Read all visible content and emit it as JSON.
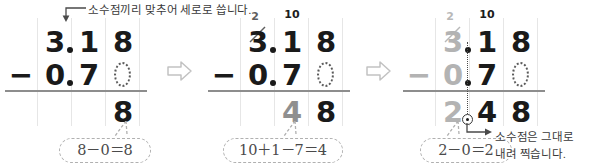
{
  "notes": {
    "top": "소수점끼리 맞추어 세로로 씁니다.",
    "side_line1": "소수점은 그대로",
    "side_line2": "내려 찍습니다."
  },
  "colors": {
    "ink": "#1a1a1a",
    "faded": "#b3b3b3",
    "mid": "#8f8f8f",
    "gridline": "#e6e6e6",
    "rule": "#8d8d8d",
    "bubble_border": "#b0b0b0"
  },
  "panels": [
    {
      "id": "panel-1",
      "minuend": {
        "ones": "3",
        "tenths": "1",
        "hundredths": "8"
      },
      "subtrahend": {
        "ones": "0",
        "tenths": "7",
        "hundredths": "0"
      },
      "result": {
        "ones": "",
        "tenths": "",
        "hundredths": "8"
      },
      "operator": "−",
      "borrow_ones": "",
      "borrow_tenths": "",
      "bubble": "8－0＝8"
    },
    {
      "id": "panel-2",
      "minuend": {
        "ones": "3",
        "tenths": "1",
        "hundredths": "8"
      },
      "subtrahend": {
        "ones": "0",
        "tenths": "7",
        "hundredths": "0"
      },
      "result": {
        "ones": "",
        "tenths": "4",
        "hundredths": "8"
      },
      "operator": "−",
      "borrow_ones": "2",
      "borrow_tenths": "10",
      "bubble": "10＋1－7＝4"
    },
    {
      "id": "panel-3",
      "minuend": {
        "ones": "3",
        "tenths": "1",
        "hundredths": "8"
      },
      "subtrahend": {
        "ones": "0",
        "tenths": "7",
        "hundredths": "0"
      },
      "result": {
        "ones": "2",
        "tenths": "4",
        "hundredths": "8"
      },
      "operator": "−",
      "borrow_ones": "2",
      "borrow_tenths": "10",
      "bubble": "2－0＝2"
    }
  ],
  "step_arrows": {
    "glyph": "arrow-right-outline",
    "count": 2
  }
}
